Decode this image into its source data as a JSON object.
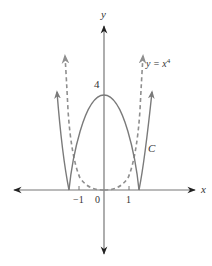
{
  "figure": {
    "axes": {
      "x_label": "x",
      "y_label": "y",
      "x_ticks": [
        {
          "value": -1,
          "label": "−1"
        },
        {
          "value": 0,
          "label": "0"
        },
        {
          "value": 1,
          "label": "1"
        }
      ],
      "y_ticks": [
        {
          "value": 4,
          "label": "4"
        }
      ]
    },
    "curves": [
      {
        "name": "C",
        "label": "C",
        "style": "solid",
        "color": "#7a7a7a",
        "description": "y = |4 - x^4| style curve: parabola cap between -1.41 and 1.41 with outer rising branches"
      },
      {
        "name": "y = x^4",
        "label_base": "y = x",
        "label_exp": "4",
        "style": "dashed",
        "color": "#8a8a8a"
      }
    ],
    "colors": {
      "axis": "#555555",
      "curve_solid": "#7a7a7a",
      "curve_dashed": "#8f8f8f",
      "text": "#333333"
    }
  }
}
